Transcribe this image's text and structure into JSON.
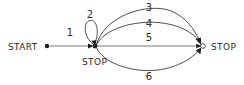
{
  "diagram": {
    "type": "state-transition-graph",
    "title": "",
    "background_color": "#ffffff",
    "stroke_color": "#3a3a3a",
    "text_color": "#2b2b2b",
    "nodes": [
      {
        "id": "start",
        "label": "START",
        "label_position": "left",
        "marker": "filled-dot",
        "x": 47,
        "y": 46
      },
      {
        "id": "middle",
        "label": "STOP",
        "label_position": "below",
        "marker": "filled-dot",
        "x": 95,
        "y": 46
      },
      {
        "id": "right",
        "label": "STOP",
        "label_position": "right",
        "marker": "hollow-circle",
        "x": 203,
        "y": 46
      }
    ],
    "edges": [
      {
        "id": "edge-1",
        "label": "1",
        "from": "start",
        "to": "middle",
        "shape": "straight",
        "label_x": 70,
        "label_y": 36
      },
      {
        "id": "edge-2",
        "label": "2",
        "from": "middle",
        "to": "middle",
        "shape": "self-loop-above",
        "label_x": 90,
        "label_y": 18
      },
      {
        "id": "edge-3",
        "label": "3",
        "from": "middle",
        "to": "right",
        "shape": "arc-above-outer",
        "label_x": 149,
        "label_y": 10
      },
      {
        "id": "edge-4",
        "label": "4",
        "from": "middle",
        "to": "right",
        "shape": "arc-above-inner",
        "label_x": 149,
        "label_y": 26
      },
      {
        "id": "edge-5",
        "label": "5",
        "from": "middle",
        "to": "right",
        "shape": "straight",
        "label_x": 149,
        "label_y": 40
      },
      {
        "id": "edge-6",
        "label": "6",
        "from": "middle",
        "to": "right",
        "shape": "arc-below",
        "label_x": 149,
        "label_y": 78
      }
    ]
  }
}
